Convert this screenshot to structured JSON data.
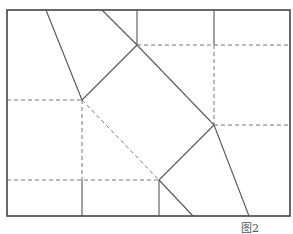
{
  "caption": "图2",
  "colors": {
    "solid": "#555555",
    "dashed": "#777777",
    "frame": "#444444"
  },
  "frame": {
    "x1": 7,
    "y1": 10,
    "x2": 290,
    "y2": 216
  },
  "vertices": {
    "left": [
      82,
      100
    ],
    "top": [
      137,
      45
    ],
    "right": [
      214,
      125
    ],
    "bottom": [
      159,
      180
    ]
  },
  "solid_lines": [
    [
      46,
      10,
      82,
      100
    ],
    [
      102,
      10,
      137,
      45
    ],
    [
      137,
      10,
      137,
      45
    ],
    [
      82,
      100,
      137,
      45
    ],
    [
      214,
      10,
      214,
      45
    ],
    [
      137,
      45,
      214,
      125
    ],
    [
      214,
      125,
      249,
      216
    ],
    [
      159,
      180,
      214,
      125
    ],
    [
      159,
      180,
      193,
      216
    ],
    [
      159,
      180,
      159,
      216
    ],
    [
      82,
      180,
      82,
      216
    ]
  ],
  "dashed_lines": [
    [
      137,
      45,
      290,
      45
    ],
    [
      214,
      45,
      214,
      125
    ],
    [
      214,
      125,
      290,
      125
    ],
    [
      7,
      100,
      82,
      100
    ],
    [
      82,
      100,
      82,
      180
    ],
    [
      82,
      100,
      159,
      180
    ],
    [
      7,
      180,
      159,
      180
    ],
    [
      137,
      45,
      214,
      125
    ]
  ]
}
